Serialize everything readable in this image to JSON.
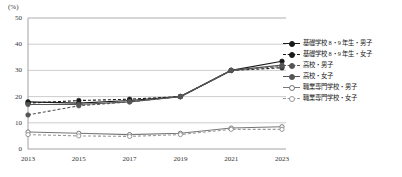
{
  "chart_data": {
    "type": "line",
    "title": "",
    "xlabel": "",
    "ylabel": "(%)",
    "unit_label": "(%)",
    "categories": [
      "2013",
      "2015",
      "2017",
      "2019",
      "2021",
      "2023"
    ],
    "x": [
      2013,
      2015,
      2017,
      2019,
      2021,
      2023
    ],
    "ylim": [
      0,
      50
    ],
    "yticks": [
      "0",
      "10",
      "20",
      "30",
      "40",
      "50"
    ],
    "ytick_values": [
      0,
      10,
      20,
      30,
      40,
      50
    ],
    "grid": "horizontal",
    "legend_position": "right",
    "series": [
      {
        "name": "基礎学校 8・9 年生・男子",
        "values": [
          18.0,
          17.5,
          18.5,
          20.0,
          30.0,
          33.5
        ],
        "color": "#1a1a1a",
        "dash": "solid",
        "marker": "filled-circle"
      },
      {
        "name": "基礎学校 8・9 年生・女子",
        "values": [
          17.5,
          18.5,
          19.0,
          20.0,
          30.0,
          31.0
        ],
        "color": "#1a1a1a",
        "dash": "dashed",
        "marker": "filled-circle"
      },
      {
        "name": "高校・男子",
        "values": [
          13.0,
          16.5,
          18.0,
          20.0,
          30.0,
          31.5
        ],
        "color": "#555555",
        "dash": "dashed",
        "marker": "filled-circle"
      },
      {
        "name": "高校・女子",
        "values": [
          17.0,
          17.0,
          18.0,
          20.0,
          30.0,
          32.0
        ],
        "color": "#555555",
        "dash": "solid",
        "marker": "filled-circle"
      },
      {
        "name": "職業専門学校・男子",
        "values": [
          6.5,
          6.0,
          5.5,
          6.0,
          8.0,
          8.5
        ],
        "color": "#777777",
        "dash": "solid",
        "marker": "open-circle"
      },
      {
        "name": "職業専門学校・女子",
        "values": [
          5.5,
          5.0,
          4.8,
          5.5,
          7.5,
          7.5
        ],
        "color": "#999999",
        "dash": "dashed",
        "marker": "open-circle"
      }
    ]
  }
}
